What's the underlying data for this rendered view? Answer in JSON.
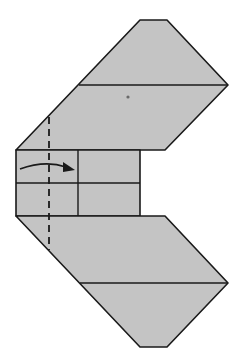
{
  "diagram": {
    "type": "origami-fold-step",
    "colors": {
      "background": "#ffffff",
      "paper": "#c4c4c4",
      "line": "#1a1a1a",
      "dot": "#6a6a6a"
    },
    "shapes": {
      "upper_flap": "16,150 140,20 167,20 228,85 165,150",
      "upper_crease": {
        "x1": 79,
        "y1": 85,
        "x2": 228,
        "y2": 85
      },
      "center_block": {
        "x": 16,
        "y": 150,
        "w": 124,
        "h": 66
      },
      "center_hcrease": {
        "x1": 16,
        "y1": 183,
        "x2": 140,
        "y2": 183
      },
      "center_vcrease": {
        "x1": 78,
        "y1": 150,
        "x2": 78,
        "y2": 216
      },
      "lower_flap": "16,216 165,216 228,283 167,347 140,347",
      "lower_crease": {
        "x1": 80,
        "y1": 283,
        "x2": 228,
        "y2": 283
      },
      "valley_fold_line": {
        "x1": 49,
        "y1": 117,
        "x2": 49,
        "y2": 250
      },
      "fold_arrow": {
        "path": "M20,169 Q45,160 66,167",
        "head": "75,170 63,162 63,172"
      },
      "reference_dot": {
        "cx": 128,
        "cy": 97,
        "r": 1.6
      }
    }
  }
}
